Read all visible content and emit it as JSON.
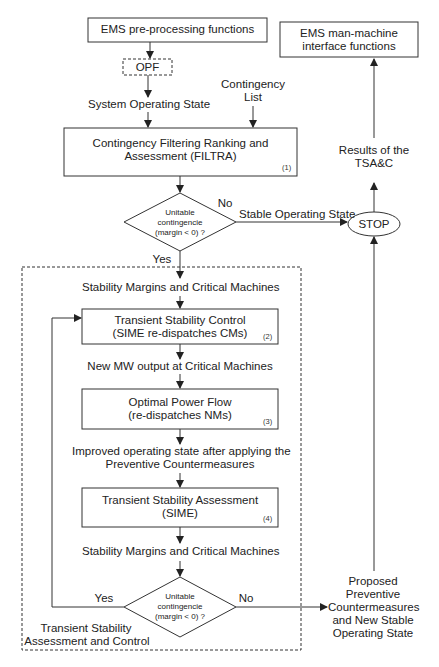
{
  "diagram": {
    "nodes": {
      "ems_pre": {
        "label": "EMS pre-processing functions"
      },
      "opf_dashed": {
        "label": "OPF"
      },
      "ems_mmi": {
        "line1": "EMS man-machine",
        "line2": "interface functions"
      },
      "filtra": {
        "line1": "Contingency Filtering Ranking and",
        "line2": "Assessment (FILTRA)",
        "number": "(1)"
      },
      "decision1": {
        "line1": "Unitable",
        "line2": "contingencie",
        "line3": "(margin < 0) ?"
      },
      "stop": {
        "label": "STOP"
      },
      "tsc": {
        "line1": "Transient Stability Control",
        "line2": "(SIME re-dispatches CMs)",
        "number": "(2)"
      },
      "opf": {
        "line1": "Optimal Power Flow",
        "line2": "(re-dispatches NMs)",
        "number": "(3)"
      },
      "tsa": {
        "line1": "Transient Stability Assessment",
        "line2": "(SIME)",
        "number": "(4)"
      },
      "decision2": {
        "line1": "Unitable",
        "line2": "contingencie",
        "line3": "(margin < 0) ?"
      },
      "tsac_group": {
        "line1": "Transient Stability",
        "line2": "Assessment and Control"
      }
    },
    "labels": {
      "system_operating_state": "System Operating State",
      "contingency_list_1": "Contingency",
      "contingency_list_2": "List",
      "no_1": "No",
      "yes_1": "Yes",
      "stable_operating_state": "Stable Operating State",
      "results_1": "Results of the",
      "results_2": "TSA&C",
      "stability_margins_1": "Stability Margins and Critical Machines",
      "new_mw_output": "New MW output at Critical Machines",
      "improved_1": "Improved operating state after applying the",
      "improved_2": "Preventive Countermeasures",
      "stability_margins_2": "Stability Margins and Critical Machines",
      "yes_2": "Yes",
      "no_2": "No",
      "proposed_1": "Proposed",
      "proposed_2": "Preventive",
      "proposed_3": "Countermeasures",
      "proposed_4": "and New Stable",
      "proposed_5": "Operating State"
    }
  }
}
